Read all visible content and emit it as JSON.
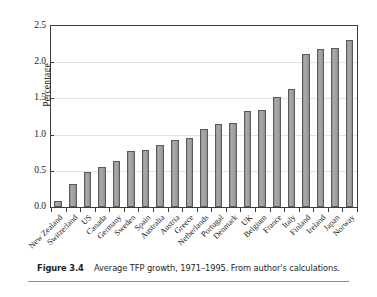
{
  "figure": {
    "caption_label": "Figure 3.4",
    "caption_text": "Average TFP growth, 1971–1995. From author's calculations."
  },
  "chart_data": {
    "type": "bar",
    "title": "",
    "xlabel": "",
    "ylabel": "Percentage",
    "ylim": [
      0.0,
      2.5
    ],
    "ytick_labels": [
      "0.0",
      "0.5",
      "1.0",
      "1.5",
      "2.0",
      "2.5"
    ],
    "ytick_values": [
      0.0,
      0.5,
      1.0,
      1.5,
      2.0,
      2.5
    ],
    "grid": true,
    "legend": "none",
    "bar_color": "#9e9e9e",
    "bar_edge_color": "#5a5a5a",
    "categories": [
      "New Zealand",
      "Switzerland",
      "US",
      "Canada",
      "Germany",
      "Sweden",
      "Spain",
      "Australia",
      "Austria",
      "Greece",
      "Netherlands",
      "Portugal",
      "Denmark",
      "UK",
      "Belgium",
      "France",
      "Italy",
      "Finland",
      "Ireland",
      "Japan",
      "Norway"
    ],
    "values": [
      0.08,
      0.32,
      0.49,
      0.55,
      0.64,
      0.77,
      0.79,
      0.86,
      0.93,
      0.96,
      1.08,
      1.14,
      1.16,
      1.32,
      1.34,
      1.52,
      1.63,
      2.11,
      2.18,
      2.2,
      2.3
    ]
  }
}
